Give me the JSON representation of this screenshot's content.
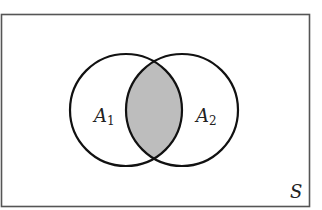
{
  "diagram": {
    "type": "venn",
    "universe_label": "S",
    "sets": [
      {
        "name": "A",
        "subscript": "1"
      },
      {
        "name": "A",
        "subscript": "2"
      }
    ],
    "shaded_region": "intersection",
    "colors": {
      "stroke": "#111111",
      "shade": "#bdbdbd",
      "background": "#ffffff",
      "frame": "#555555"
    }
  }
}
